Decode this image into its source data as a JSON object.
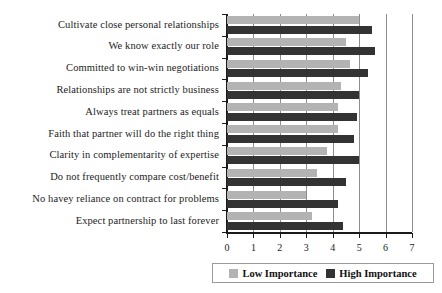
{
  "chart_data": {
    "type": "bar",
    "orientation": "horizontal",
    "title": "",
    "xlabel": "",
    "ylabel": "",
    "xlim": [
      0,
      7
    ],
    "xticks": [
      "0",
      "1",
      "2",
      "3",
      "4",
      "5",
      "6",
      "7"
    ],
    "grid": true,
    "grid_axis": "x",
    "legend_position": "bottom-right",
    "categories": [
      "Cultivate close personal relationships",
      "We know exactly our role",
      "Committed to win-win negotiations",
      "Relationships are not strictly business",
      "Always treat partners as equals",
      "Faith that partner will do the right thing",
      "Clarity in complementarity of expertise",
      "Do not frequently compare cost/benefit",
      "No havey reliance on contract for problems",
      "Expect partnership to last forever"
    ],
    "series": [
      {
        "name": "Low Importance",
        "color": "#b3b3b3",
        "values": [
          5.0,
          4.5,
          4.65,
          4.3,
          4.2,
          4.2,
          3.8,
          3.4,
          3.0,
          3.2
        ]
      },
      {
        "name": "High Importance",
        "color": "#333333",
        "values": [
          5.5,
          5.6,
          5.35,
          5.0,
          4.9,
          4.8,
          5.0,
          4.5,
          4.2,
          4.4
        ]
      }
    ]
  },
  "legend": {
    "low_label": "Low Importance",
    "high_label": "High Importance"
  }
}
